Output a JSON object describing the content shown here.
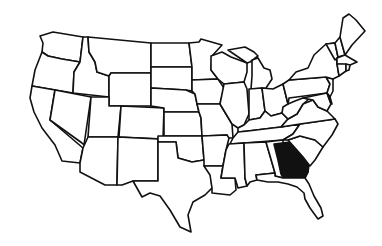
{
  "map": {
    "title": "United States map",
    "highlighted_state": "Georgia",
    "highlight_color": "#111111",
    "base_color": "#ffffff",
    "border_color": "#111111"
  }
}
